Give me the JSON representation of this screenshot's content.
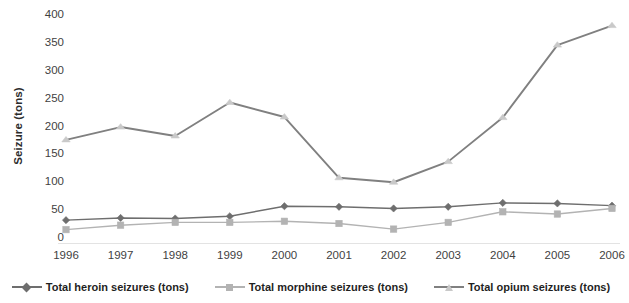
{
  "chart_data": {
    "type": "line",
    "title": "",
    "xlabel": "",
    "ylabel": "Seizure (tons)",
    "categories": [
      "1996",
      "1997",
      "1998",
      "1999",
      "2000",
      "2001",
      "2002",
      "2003",
      "2004",
      "2005",
      "2006"
    ],
    "x": [
      1996,
      1997,
      1998,
      1999,
      2000,
      2001,
      2002,
      2003,
      2004,
      2005,
      2006
    ],
    "ylim": [
      0,
      400
    ],
    "yticks": [
      0,
      50,
      100,
      150,
      200,
      250,
      300,
      350,
      400
    ],
    "ytick_labels": [
      "0",
      "50",
      "100",
      "150",
      "200",
      "250",
      "300",
      "350",
      "400"
    ],
    "grid": false,
    "legend_position": "bottom",
    "series": [
      {
        "name": "Total heroin seizures (tons)",
        "marker": "diamond",
        "color": "#6e6e6e",
        "values": [
          32,
          36,
          35,
          39,
          57,
          56,
          53,
          56,
          63,
          62,
          58
        ]
      },
      {
        "name": "Total morphine seizures (tons)",
        "marker": "square",
        "color": "#b3b3b3",
        "values": [
          15,
          23,
          28,
          28,
          30,
          26,
          16,
          28,
          47,
          43,
          53
        ]
      },
      {
        "name": "Total opium seizures (tons)",
        "marker": "triangle",
        "color": "#808080",
        "values": [
          176,
          199,
          183,
          243,
          217,
          108,
          100,
          137,
          216,
          346,
          381
        ]
      }
    ]
  },
  "legend": {
    "entries": [
      {
        "label": "Total heroin seizures (tons)"
      },
      {
        "label": "Total morphine seizures (tons)"
      },
      {
        "label": "Total opium seizures (tons)"
      }
    ]
  },
  "axes": {
    "y_title": "Seizure (tons)"
  }
}
